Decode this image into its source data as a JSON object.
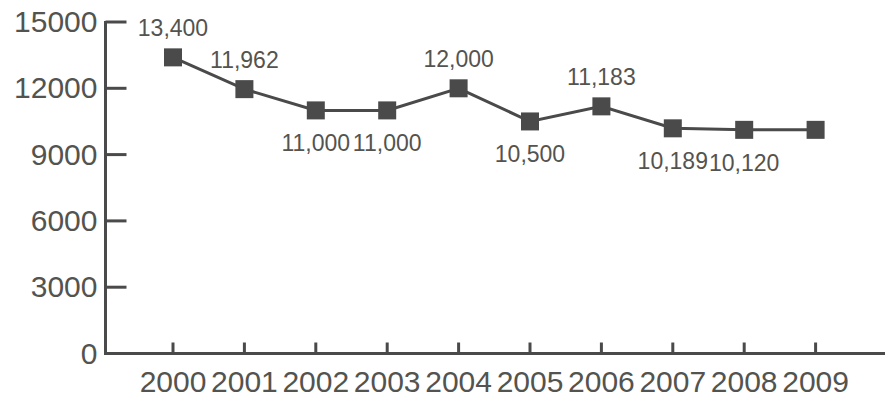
{
  "chart_data": {
    "type": "line",
    "title": "",
    "subtitle": "",
    "xlabel": "",
    "ylabel": "",
    "categories": [
      "2000",
      "2001",
      "2002",
      "2003",
      "2004",
      "2005",
      "2006",
      "2007",
      "2008",
      "2009"
    ],
    "values": [
      13400,
      11962,
      11000,
      11000,
      12000,
      10500,
      11183,
      10189,
      10120,
      10120
    ],
    "point_labels": [
      "13,400",
      "11,962",
      "11,000",
      "11,000",
      "12,000",
      "10,500",
      "11,183",
      "10,189",
      "10,120"
    ],
    "points": [
      {
        "x": "2000",
        "y": 13400,
        "label": "13,400",
        "label_position": "above"
      },
      {
        "x": "2001",
        "y": 11962,
        "label": "11,962",
        "label_position": "above"
      },
      {
        "x": "2002",
        "y": 11000,
        "label": "11,000",
        "label_position": "below"
      },
      {
        "x": "2003",
        "y": 11000,
        "label": "11,000",
        "label_position": "below"
      },
      {
        "x": "2004",
        "y": 12000,
        "label": "12,000",
        "label_position": "above"
      },
      {
        "x": "2005",
        "y": 10500,
        "label": "10,500",
        "label_position": "below"
      },
      {
        "x": "2006",
        "y": 11183,
        "label": "11,183",
        "label_position": "above"
      },
      {
        "x": "2007",
        "y": 10189,
        "label": "10,189",
        "label_position": "below"
      },
      {
        "x": "2008",
        "y": 10120,
        "label": "10,120",
        "label_position": "below"
      }
    ],
    "ylim": [
      0,
      15000
    ],
    "yticks": [
      0,
      3000,
      6000,
      9000,
      12000,
      15000
    ],
    "ytick_labels": [
      "0",
      "3000",
      "6000",
      "9000",
      "12000",
      "15000"
    ],
    "xtick_labels": [
      "2000",
      "2001",
      "2002",
      "2003",
      "2004",
      "2005",
      "2006",
      "2007",
      "2008",
      "2009"
    ],
    "grid": false,
    "legend": null,
    "series": [
      {
        "name": "",
        "marker": "square",
        "marker_color": "#4a4a4a",
        "line_color": "#4a4a4a",
        "values": [
          13400,
          11962,
          11000,
          11000,
          12000,
          10500,
          11183,
          10189,
          10120,
          10120
        ]
      }
    ],
    "colors": {
      "line": "#4a4a4a",
      "marker": "#4a4a4a",
      "axis": "#4a4a4a",
      "text": "#53534f",
      "background": "#ffffff"
    }
  },
  "axes": {
    "y_ticks": [
      {
        "label": "15000",
        "value": 15000
      },
      {
        "label": "12000",
        "value": 12000
      },
      {
        "label": "9000",
        "value": 9000
      },
      {
        "label": "6000",
        "value": 6000
      },
      {
        "label": "3000",
        "value": 3000
      },
      {
        "label": "0",
        "value": 0
      }
    ],
    "x_ticks": [
      {
        "label": "2000"
      },
      {
        "label": "2001"
      },
      {
        "label": "2002"
      },
      {
        "label": "2003"
      },
      {
        "label": "2004"
      },
      {
        "label": "2005"
      },
      {
        "label": "2006"
      },
      {
        "label": "2007"
      },
      {
        "label": "2008"
      },
      {
        "label": "2009"
      }
    ]
  }
}
